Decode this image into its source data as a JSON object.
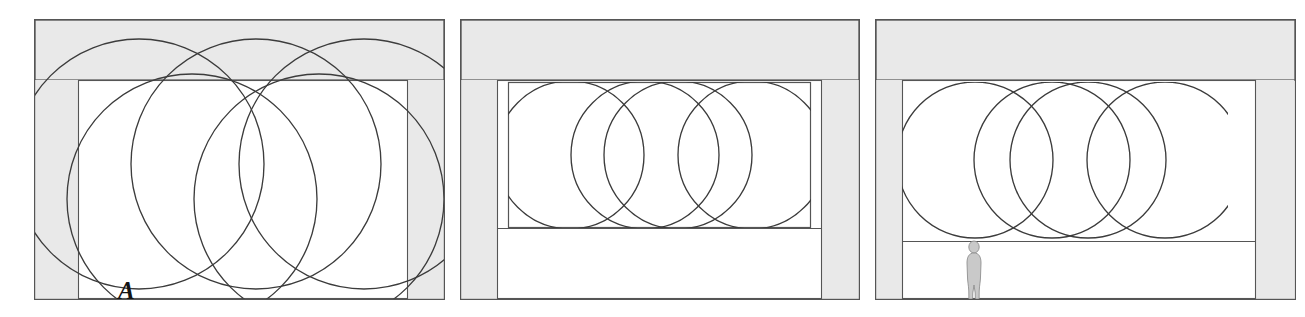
{
  "figure": {
    "type": "architectural-elevation-diagram",
    "panel_count": 3
  },
  "colors": {
    "stroke": "#3c3c3c",
    "line": "#555555",
    "gray_fill": "#e9e9e9",
    "gray_fill_dark": "#dedede",
    "figure_fill": "#c9c9c9",
    "background": "#ffffff",
    "label_color": "#141414"
  },
  "panels": [
    {
      "id": "A",
      "label": "A",
      "x": 34,
      "y": 19,
      "width": 411,
      "height": 281,
      "label_x": 84,
      "label_y": 259,
      "beam": {
        "x": 1,
        "y": 1,
        "width": 409,
        "height": 60
      },
      "piers": [
        {
          "x": 1,
          "y": 61,
          "width": 43,
          "height": 219
        },
        {
          "x": 374,
          "y": 61,
          "width": 36,
          "height": 219
        }
      ],
      "inner_frame": {
        "x": 44,
        "y": 61,
        "width": 330,
        "height": 219
      },
      "circles_row_upper": [
        {
          "cx": 105,
          "cy": 145,
          "r": 125
        },
        {
          "cx": 222,
          "cy": 145,
          "r": 125
        },
        {
          "cx": 330,
          "cy": 145,
          "r": 125
        }
      ],
      "circles_row_lower": [
        {
          "cx": 158,
          "cy": 180,
          "r": 125
        },
        {
          "cx": 285,
          "cy": 180,
          "r": 125
        }
      ],
      "clipped": false
    },
    {
      "id": "B",
      "label": "B",
      "x": 460,
      "y": 19,
      "width": 400,
      "height": 281,
      "label_x": 497,
      "label_y": 259,
      "beam": {
        "x": 1,
        "y": 1,
        "width": 398,
        "height": 60
      },
      "piers": [
        {
          "x": 1,
          "y": 61,
          "width": 36,
          "height": 219
        },
        {
          "x": 362,
          "y": 61,
          "width": 37,
          "height": 219
        }
      ],
      "inner_frame": {
        "x": 37,
        "y": 61,
        "width": 325,
        "height": 219
      },
      "vault_box": {
        "x": 48,
        "y": 63,
        "width": 303,
        "height": 146
      },
      "circles": [
        {
          "cx": 110,
          "cy": 136,
          "r": 74
        },
        {
          "cx": 185,
          "cy": 136,
          "r": 74
        },
        {
          "cx": 218,
          "cy": 136,
          "r": 74
        },
        {
          "cx": 292,
          "cy": 136,
          "r": 74
        }
      ],
      "clipped": true
    },
    {
      "id": "C",
      "label": "C",
      "x": 875,
      "y": 19,
      "width": 421,
      "height": 281,
      "label_x": 917,
      "label_y": 259,
      "beam": {
        "x": 1,
        "y": 1,
        "width": 419,
        "height": 60
      },
      "piers": [
        {
          "x": 1,
          "y": 61,
          "width": 26,
          "height": 219
        },
        {
          "x": 381,
          "y": 61,
          "width": 38,
          "height": 219
        }
      ],
      "inner_frame": {
        "x": 27,
        "y": 61,
        "width": 354,
        "height": 219
      },
      "vault_box": {
        "x": 26,
        "y": 63,
        "width": 327,
        "height": 160
      },
      "circles": [
        {
          "cx": 100,
          "cy": 141,
          "r": 78
        },
        {
          "cx": 177,
          "cy": 141,
          "r": 78
        },
        {
          "cx": 213,
          "cy": 141,
          "r": 78
        },
        {
          "cx": 290,
          "cy": 141,
          "r": 78
        }
      ],
      "human_figure": {
        "x": 92,
        "y": 218,
        "height": 74,
        "name": "scale-figure"
      },
      "clipped": true
    }
  ]
}
